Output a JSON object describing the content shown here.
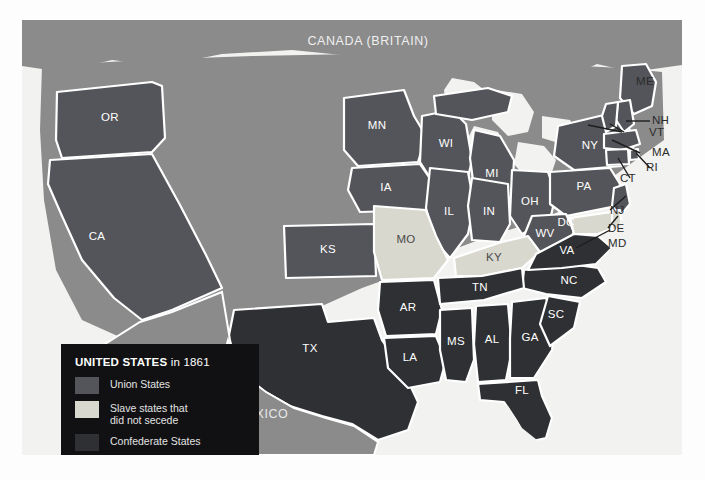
{
  "map": {
    "title_country_north": "CANADA (BRITAIN)",
    "title_country_south": "MEXICO",
    "colors": {
      "union": "#54555a",
      "slave_no_secede": "#d8d8cf",
      "confederate": "#2e3033",
      "territory": "#8b8b8b",
      "water": "#f2f2f0",
      "border": "#ffffff",
      "legend_bg": "#111113",
      "page_bg": "#fdfdfd"
    },
    "states": [
      {
        "code": "OR",
        "category": "union"
      },
      {
        "code": "CA",
        "category": "union"
      },
      {
        "code": "KS",
        "category": "union"
      },
      {
        "code": "MN",
        "category": "union"
      },
      {
        "code": "IA",
        "category": "union"
      },
      {
        "code": "WI",
        "category": "union"
      },
      {
        "code": "MI",
        "category": "union"
      },
      {
        "code": "IL",
        "category": "union"
      },
      {
        "code": "IN",
        "category": "union"
      },
      {
        "code": "OH",
        "category": "union"
      },
      {
        "code": "PA",
        "category": "union"
      },
      {
        "code": "NY",
        "category": "union"
      },
      {
        "code": "WV",
        "category": "union"
      },
      {
        "code": "ME",
        "category": "union"
      },
      {
        "code": "NH",
        "category": "union"
      },
      {
        "code": "VT",
        "category": "union"
      },
      {
        "code": "MA",
        "category": "union"
      },
      {
        "code": "RI",
        "category": "union"
      },
      {
        "code": "CT",
        "category": "union"
      },
      {
        "code": "NJ",
        "category": "union"
      },
      {
        "code": "MO",
        "category": "slave_no_secede"
      },
      {
        "code": "KY",
        "category": "slave_no_secede"
      },
      {
        "code": "MD",
        "category": "slave_no_secede"
      },
      {
        "code": "DE",
        "category": "slave_no_secede"
      },
      {
        "code": "DC",
        "category": "slave_no_secede"
      },
      {
        "code": "TX",
        "category": "confederate"
      },
      {
        "code": "AR",
        "category": "confederate"
      },
      {
        "code": "LA",
        "category": "confederate"
      },
      {
        "code": "MS",
        "category": "confederate"
      },
      {
        "code": "AL",
        "category": "confederate"
      },
      {
        "code": "GA",
        "category": "confederate"
      },
      {
        "code": "FL",
        "category": "confederate"
      },
      {
        "code": "SC",
        "category": "confederate"
      },
      {
        "code": "NC",
        "category": "confederate"
      },
      {
        "code": "TN",
        "category": "confederate"
      },
      {
        "code": "VA",
        "category": "confederate"
      }
    ]
  },
  "labels": {
    "OR": "OR",
    "CA": "CA",
    "KS": "KS",
    "MN": "MN",
    "IA": "IA",
    "WI": "WI",
    "MI": "MI",
    "IL": "IL",
    "IN": "IN",
    "OH": "OH",
    "PA": "PA",
    "NY": "NY",
    "WV": "WV",
    "MO": "MO",
    "KY": "KY",
    "VA": "VA",
    "NC": "NC",
    "SC": "SC",
    "GA": "GA",
    "AL": "AL",
    "MS": "MS",
    "LA": "LA",
    "AR": "AR",
    "TN": "TN",
    "TX": "TX",
    "FL": "FL",
    "DC": "DC",
    "ME": "ME",
    "NH": "NH",
    "VT": "VT",
    "MA": "MA",
    "RI": "RI",
    "CT": "CT",
    "NJ": "NJ",
    "DE": "DE",
    "MD": "MD"
  },
  "legend": {
    "title_bold": "UNITED STATES",
    "title_rest": " in 1861",
    "items": [
      {
        "label": "Union States",
        "label2": "",
        "color": "#54555a"
      },
      {
        "label": "Slave states that",
        "label2": "did not secede",
        "color": "#d8d8cf"
      },
      {
        "label": "Confederate States",
        "label2": "",
        "color": "#2e3033"
      }
    ]
  }
}
